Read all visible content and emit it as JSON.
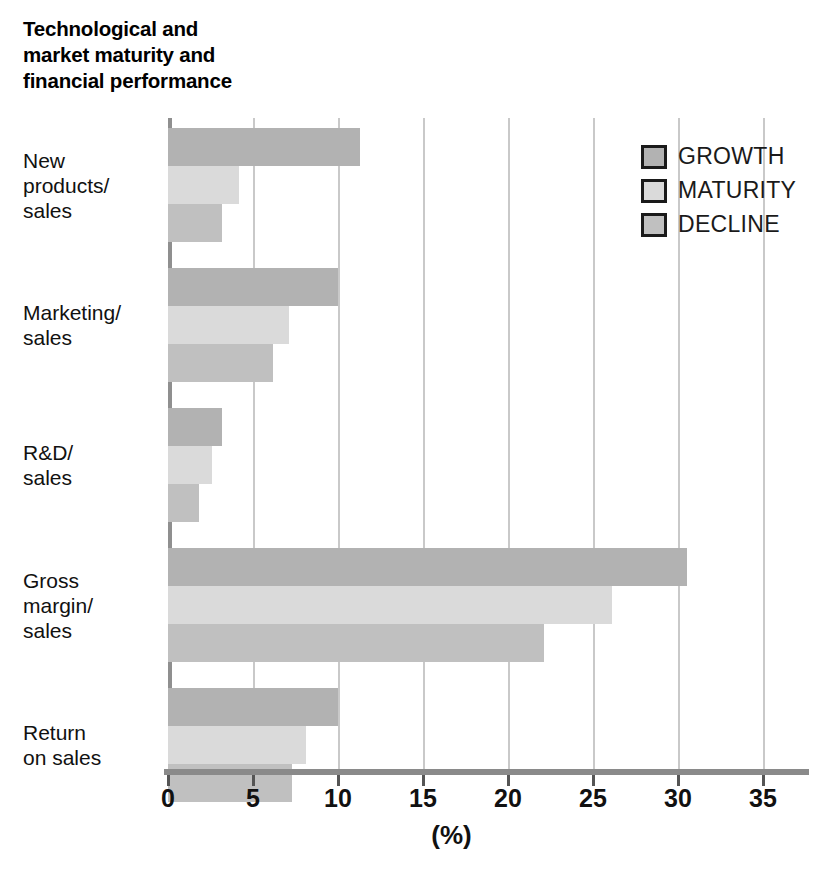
{
  "chart_data": {
    "type": "bar",
    "orientation": "horizontal",
    "title": "Technological and\nmarket maturity and\nfinancial performance",
    "xlabel": "(%)",
    "ylabel": "",
    "xlim": [
      0,
      35
    ],
    "xticks": [
      0,
      5,
      10,
      15,
      20,
      25,
      30,
      35
    ],
    "xtick_labels": [
      "0",
      "5",
      "10",
      "15",
      "20",
      "25",
      "30",
      "35"
    ],
    "grid": true,
    "legend_position": "top-right",
    "categories": [
      "New\nproducts/\nsales",
      "Marketing/\nsales",
      "R&D/\nsales",
      "Gross\nmargin/\nsales",
      "Return\non sales"
    ],
    "series": [
      {
        "name": "GROWTH",
        "color": "#b2b2b2",
        "values": [
          11.3,
          10.0,
          3.2,
          30.5,
          10.0
        ]
      },
      {
        "name": "MATURITY",
        "color": "#dadada",
        "values": [
          4.2,
          7.1,
          2.6,
          26.1,
          8.1
        ]
      },
      {
        "name": "DECLINE",
        "color": "#c0c0c0",
        "values": [
          3.2,
          6.2,
          1.8,
          22.1,
          7.3
        ]
      }
    ]
  },
  "legend": {
    "items": [
      {
        "label": "GROWTH",
        "swatch": "growth"
      },
      {
        "label": "MATURITY",
        "swatch": "maturity"
      },
      {
        "label": "DECLINE",
        "swatch": "decline"
      }
    ]
  },
  "colors": {
    "growth": "#b2b2b2",
    "maturity": "#dadada",
    "decline": "#c0c0c0",
    "gridline": "#c9c9c9",
    "axis": "#8a8a8a",
    "text": "#111111"
  }
}
